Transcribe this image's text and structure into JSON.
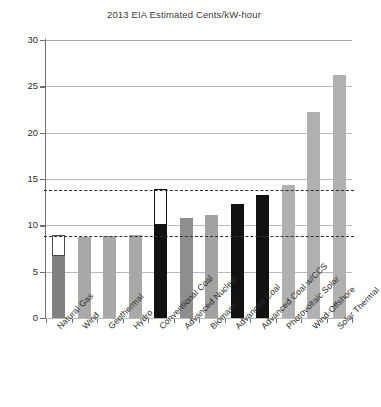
{
  "chart_data": {
    "type": "bar",
    "title": "2013 EIA Estimated Cents/kW-hour",
    "xlabel": "",
    "ylabel": "",
    "ylim": [
      0,
      30
    ],
    "yticks": [
      0,
      5,
      10,
      15,
      20,
      25,
      30
    ],
    "grid": true,
    "legend": false,
    "categories": [
      "Natural Gas",
      "Wind",
      "Geothermal",
      "Hydro",
      "Conventional Coal",
      "Advanced Nuclear",
      "Biomass",
      "Advanced Coal",
      "Advanced Coal w/CCS",
      "Photovoltaic Solar",
      "Wind-Offshore",
      "Solar Thermal"
    ],
    "values": [
      8.8,
      8.7,
      8.8,
      9.0,
      13.8,
      10.8,
      11.1,
      12.3,
      13.3,
      14.4,
      22.2,
      26.2
    ],
    "bars": [
      {
        "label": "Natural Gas",
        "value": 8.8,
        "solid_value": 6.7,
        "color": "#808080",
        "has_hollow_top": true
      },
      {
        "label": "Wind",
        "value": 8.7,
        "solid_value": 8.7,
        "color": "#a8a8a8",
        "has_hollow_top": false
      },
      {
        "label": "Geothermal",
        "value": 8.8,
        "solid_value": 8.8,
        "color": "#a8a8a8",
        "has_hollow_top": false
      },
      {
        "label": "Hydro",
        "value": 9.0,
        "solid_value": 9.0,
        "color": "#a8a8a8",
        "has_hollow_top": false
      },
      {
        "label": "Conventional Coal",
        "value": 13.8,
        "solid_value": 10.0,
        "color": "#121212",
        "has_hollow_top": true
      },
      {
        "label": "Advanced Nuclear",
        "value": 10.8,
        "solid_value": 10.8,
        "color": "#8e8e8e",
        "has_hollow_top": false
      },
      {
        "label": "Biomass",
        "value": 11.1,
        "solid_value": 11.1,
        "color": "#a2a2a2",
        "has_hollow_top": false
      },
      {
        "label": "Advanced Coal",
        "value": 12.3,
        "solid_value": 12.3,
        "color": "#121212",
        "has_hollow_top": false
      },
      {
        "label": "Advanced Coal w/CCS",
        "value": 13.3,
        "solid_value": 13.3,
        "color": "#121212",
        "has_hollow_top": false
      },
      {
        "label": "Photovoltaic Solar",
        "value": 14.4,
        "solid_value": 14.4,
        "color": "#b0b0b0",
        "has_hollow_top": false
      },
      {
        "label": "Wind-Offshore",
        "value": 22.2,
        "solid_value": 22.2,
        "color": "#b0b0b0",
        "has_hollow_top": false
      },
      {
        "label": "Solar Thermal",
        "value": 26.2,
        "solid_value": 26.2,
        "color": "#b0b0b0",
        "has_hollow_top": false
      }
    ],
    "reference_lines": [
      {
        "name": "upper-dashed-reference",
        "value": 13.8,
        "style": "dashed"
      },
      {
        "name": "lower-dashed-reference",
        "value": 8.8,
        "style": "dashed"
      }
    ],
    "colors": {
      "grid": "#b9b9b9",
      "axis": "#6e6e6e",
      "dashed_reference": "#2f2f2f",
      "text": "#2d2d2d",
      "title": "#3a3a3a",
      "background": "#ffffff"
    }
  }
}
